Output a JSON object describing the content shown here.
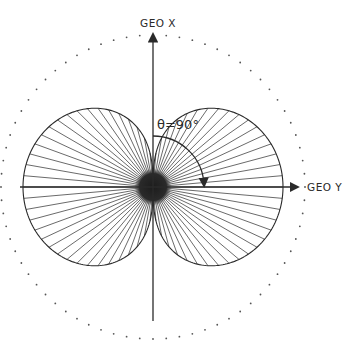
{
  "diagram": {
    "type": "polar-radiation-pattern",
    "center": [
      153,
      187
    ],
    "axes": {
      "vertical_label": "GEO X",
      "horizontal_label": "GEO Y"
    },
    "angle_annotation": "θ=90°",
    "outer_circle": {
      "radius": 152,
      "style": "dotted"
    },
    "lobes": {
      "count": 2,
      "orientation": "along GEO Y (horizontal)",
      "max_radius": 130,
      "half_height": 60,
      "spoke_step_deg": 5,
      "core_radius": 18
    },
    "colors": {
      "ink": "#2a2a2a",
      "core": "#1c1c1c",
      "dots": "#555555",
      "background": "#ffffff"
    }
  }
}
